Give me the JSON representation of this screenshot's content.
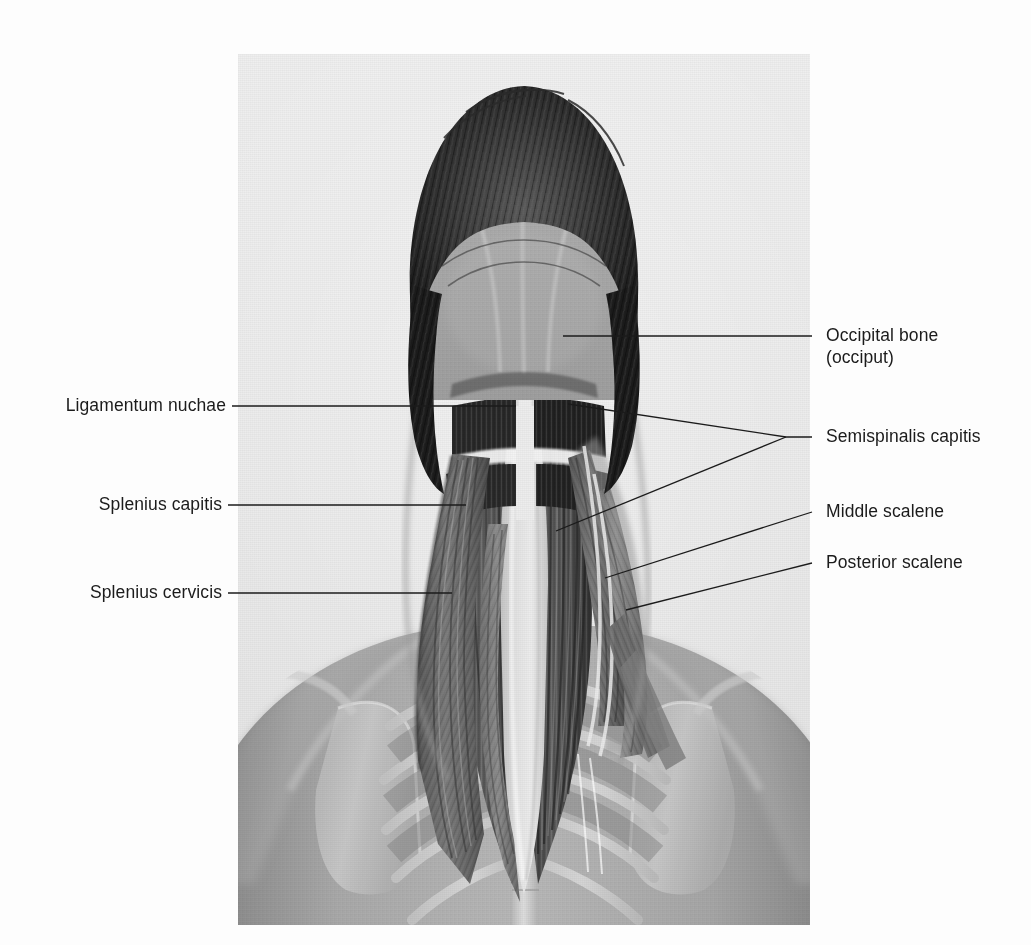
{
  "figure": {
    "kind": "anatomical-photograph-illustration",
    "view": "posterior view of head, neck and upper back",
    "background_color": "#fdfdfd",
    "plate_background_color": "#ececec"
  },
  "labels": {
    "occipital_bone": {
      "line1": "Occipital bone",
      "line2": "(occiput)",
      "side": "right"
    },
    "semispinalis_capitis": {
      "text": "Semispinalis capitis",
      "side": "right"
    },
    "middle_scalene": {
      "text": "Middle scalene",
      "side": "right"
    },
    "posterior_scalene": {
      "text": "Posterior scalene",
      "side": "right"
    },
    "ligamentum_nuchae": {
      "text": "Ligamentum nuchae",
      "side": "left"
    },
    "splenius_capitis": {
      "text": "Splenius capitis",
      "side": "left"
    },
    "splenius_cervicis": {
      "text": "Splenius cervicis",
      "side": "left"
    }
  },
  "leader_color": "#1b1b1b",
  "structures": [
    "hair",
    "skull",
    "occipital bone",
    "ligamentum nuchae",
    "semispinalis capitis",
    "splenius capitis",
    "splenius cervicis",
    "middle scalene",
    "posterior scalene",
    "trapezius outline",
    "scapula",
    "ribs",
    "thoracic spine"
  ]
}
